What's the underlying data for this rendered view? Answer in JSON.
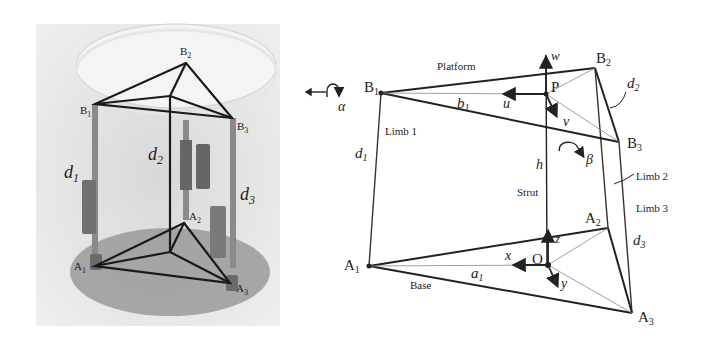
{
  "photo": {
    "labels": {
      "B1": "B",
      "B1_sub": "1",
      "B2": "B",
      "B2_sub": "2",
      "B3": "B",
      "B3_sub": "3",
      "A1": "A",
      "A1_sub": "1",
      "A2": "A",
      "A2_sub": "2",
      "A3": "A",
      "A3_sub": "3",
      "d1": "d",
      "d1_sub": "1",
      "d2": "d",
      "d2_sub": "2",
      "d3": "d",
      "d3_sub": "3"
    }
  },
  "diagram": {
    "platform_label": "Platform",
    "base_label": "Base",
    "strut_label": "Strut",
    "limb1_label": "Limb 1",
    "limb2_label": "Limb 2",
    "limb3_label": "Limb 3",
    "points": {
      "B1": "B",
      "B1_sub": "1",
      "B2": "B",
      "B2_sub": "2",
      "B3": "B",
      "B3_sub": "3",
      "A1": "A",
      "A1_sub": "1",
      "A2": "A",
      "A2_sub": "2",
      "A3": "A",
      "A3_sub": "3",
      "P": "P",
      "O": "O"
    },
    "axes": {
      "u": "u",
      "v": "v",
      "w": "w",
      "x": "x",
      "y": "y",
      "z": "z"
    },
    "params": {
      "h": "h",
      "alpha": "α",
      "beta": "β",
      "b1": "b",
      "b1_sub": "1",
      "a1": "a",
      "a1_sub": "1",
      "d1": "d",
      "d1_sub": "1",
      "d2": "d",
      "d2_sub": "2",
      "d3": "d",
      "d3_sub": "3"
    }
  }
}
